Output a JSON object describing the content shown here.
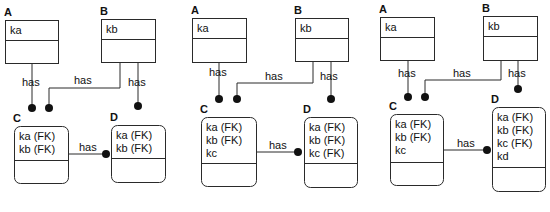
{
  "diagram": {
    "title": "",
    "relationship_label": "has",
    "panels": [
      {
        "id": "panel-1",
        "entities": [
          {
            "name": "A",
            "x": 5,
            "y": 20,
            "w": 53,
            "h": 43,
            "div": 40,
            "rounded": false,
            "keys": [
              "ka"
            ]
          },
          {
            "name": "B",
            "x": 101,
            "y": 19,
            "w": 54,
            "h": 43,
            "div": 39,
            "rounded": false,
            "keys": [
              "kb"
            ]
          },
          {
            "name": "C",
            "x": 14,
            "y": 126,
            "w": 54,
            "h": 57,
            "div": 160,
            "rounded": true,
            "keys": [
              "ka (FK)",
              "kb (FK)"
            ]
          },
          {
            "name": "D",
            "x": 111,
            "y": 125,
            "w": 54,
            "h": 57,
            "div": 158,
            "rounded": true,
            "keys": [
              "ka (FK)",
              "kb (FK)"
            ]
          }
        ],
        "relationships": [
          {
            "label": "has",
            "points": [
              [
                32,
                63
              ],
              [
                32,
                108
              ]
            ],
            "dot": [
              32,
              108
            ],
            "label_pos": [
              22,
              86
            ]
          },
          {
            "label": "has",
            "points": [
              [
                120,
                62
              ],
              [
                120,
                88
              ],
              [
                49,
                88
              ],
              [
                49,
                108
              ]
            ],
            "dot": [
              49,
              108
            ],
            "label_pos": [
              74,
              84
            ]
          },
          {
            "label": "has",
            "points": [
              [
                138,
                62
              ],
              [
                138,
                106
              ]
            ],
            "dot": [
              138,
              106
            ],
            "label_pos": [
              128,
              86
            ]
          },
          {
            "label": "has",
            "points": [
              [
                68,
                154
              ],
              [
                106,
                154
              ]
            ],
            "dot": [
              106,
              154
            ],
            "label_pos": [
              79,
              151
            ]
          }
        ]
      },
      {
        "id": "panel-2",
        "entities": [
          {
            "name": "A",
            "x": 192,
            "y": 18,
            "w": 54,
            "h": 44,
            "div": 38,
            "rounded": false,
            "keys": [
              "ka"
            ]
          },
          {
            "name": "B",
            "x": 295,
            "y": 18,
            "w": 53,
            "h": 43,
            "div": 38,
            "rounded": false,
            "keys": [
              "kb"
            ]
          },
          {
            "name": "C",
            "x": 201,
            "y": 117,
            "w": 55,
            "h": 69,
            "div": 163,
            "rounded": true,
            "keys": [
              "ka (FK)",
              "kb (FK)",
              "kc"
            ]
          },
          {
            "name": "D",
            "x": 304,
            "y": 117,
            "w": 53,
            "h": 70,
            "div": 163,
            "rounded": true,
            "keys": [
              "ka (FK)",
              "kb (FK)",
              "kc (FK)"
            ]
          }
        ],
        "relationships": [
          {
            "label": "has",
            "points": [
              [
                219,
                62
              ],
              [
                219,
                99
              ]
            ],
            "dot": [
              219,
              99
            ],
            "label_pos": [
              209,
              76
            ]
          },
          {
            "label": "has",
            "points": [
              [
                313,
                61
              ],
              [
                313,
                83
              ],
              [
                237,
                83
              ],
              [
                237,
                99
              ]
            ],
            "dot": [
              237,
              99
            ],
            "label_pos": [
              265,
              80
            ]
          },
          {
            "label": "has",
            "points": [
              [
                331,
                61
              ],
              [
                331,
                99
              ]
            ],
            "dot": [
              331,
              99
            ],
            "label_pos": [
              320,
              80
            ]
          },
          {
            "label": "has",
            "points": [
              [
                256,
                152
              ],
              [
                298,
                152
              ]
            ],
            "dot": [
              298,
              152
            ],
            "label_pos": [
              269,
              149
            ]
          }
        ]
      },
      {
        "id": "panel-3",
        "entities": [
          {
            "name": "A",
            "x": 380,
            "y": 17,
            "w": 54,
            "h": 43,
            "div": 37,
            "rounded": false,
            "keys": [
              "ka"
            ]
          },
          {
            "name": "B",
            "x": 483,
            "y": 16,
            "w": 54,
            "h": 44,
            "div": 36,
            "rounded": false,
            "keys": [
              "kb"
            ]
          },
          {
            "name": "C",
            "x": 390,
            "y": 114,
            "w": 53,
            "h": 71,
            "div": 162,
            "rounded": true,
            "keys": [
              "ka (FK)",
              "kb (FK)",
              "kc"
            ]
          },
          {
            "name": "D",
            "x": 492,
            "y": 107,
            "w": 53,
            "h": 84,
            "div": 167,
            "rounded": true,
            "keys": [
              "ka (FK)",
              "kb (FK)",
              "kc (FK)",
              "kd"
            ]
          }
        ],
        "relationships": [
          {
            "label": "has",
            "points": [
              [
                408,
                60
              ],
              [
                408,
                97
              ]
            ],
            "dot": [
              408,
              97
            ],
            "label_pos": [
              398,
              77
            ]
          },
          {
            "label": "has",
            "points": [
              [
                501,
                60
              ],
              [
                501,
                80
              ],
              [
                425,
                80
              ],
              [
                425,
                97
              ]
            ],
            "dot": [
              425,
              97
            ],
            "label_pos": [
              453,
              77
            ]
          },
          {
            "label": "has",
            "points": [
              [
                518,
                60
              ],
              [
                518,
                89
              ]
            ],
            "dot": [
              518,
              89
            ],
            "label_pos": [
              508,
              77
            ]
          },
          {
            "label": "has",
            "points": [
              [
                443,
                150
              ],
              [
                487,
                150
              ]
            ],
            "dot": [
              487,
              150
            ],
            "label_pos": [
              457,
              147
            ]
          }
        ]
      }
    ]
  }
}
